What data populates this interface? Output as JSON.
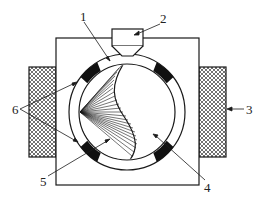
{
  "diagram": {
    "labels": {
      "l1": "1",
      "l2": "2",
      "l3": "3",
      "l4": "4",
      "l5": "5",
      "l6": "6"
    },
    "parts": [
      {
        "id": "1",
        "name": "outer ring / drum shell"
      },
      {
        "id": "2",
        "name": "feed hopper"
      },
      {
        "id": "3",
        "name": "external hatched block (right)"
      },
      {
        "id": "4",
        "name": "inner empty region"
      },
      {
        "id": "5",
        "name": "striated (lined) region"
      },
      {
        "id": "6",
        "name": "black segments on ring"
      }
    ],
    "colors": {
      "stroke": "#1a1a1a",
      "fill_dark": "#111111",
      "background": "#ffffff"
    }
  }
}
